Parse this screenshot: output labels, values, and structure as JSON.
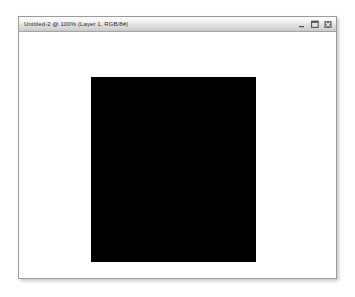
{
  "window": {
    "title": "Untitled-2 @ 100% (Layer 1, RGB/8#)",
    "document_name": "Untitled-2",
    "zoom_level": "100%",
    "active_layer": "Layer 1",
    "color_mode": "RGB/8#",
    "controls": [
      {
        "name": "minimize",
        "glyph": "minimize-icon",
        "label": "Minimize"
      },
      {
        "name": "maximize",
        "glyph": "maximize-icon",
        "label": "Maximize"
      },
      {
        "name": "close",
        "glyph": "close-icon",
        "label": "Close"
      }
    ],
    "title_bar_color": "#e2e2e2",
    "border_color": "#9a9a9a"
  },
  "canvas": {
    "background_color": "#ffffff",
    "artwork": {
      "name": "filled-rectangle",
      "fill_color": "#000000",
      "shape": "rectangle"
    }
  }
}
